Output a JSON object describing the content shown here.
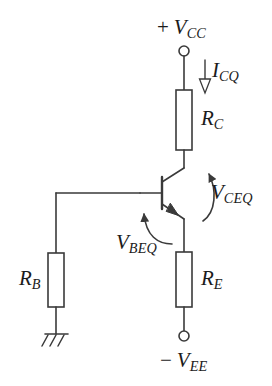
{
  "figure": {
    "type": "circuit-schematic",
    "line_color": "#3a3a3a",
    "text_color": "#1b1b1b",
    "background": "#ffffff"
  },
  "labels": {
    "vcc": {
      "sign": "+",
      "symbol": "V",
      "subscript": "CC",
      "full": "+ VCC"
    },
    "vee": {
      "sign": "−",
      "symbol": "V",
      "subscript": "EE",
      "full": "− VEE"
    },
    "icq": {
      "symbol": "I",
      "subscript": "CQ",
      "full": "ICQ"
    },
    "rc": {
      "symbol": "R",
      "subscript": "C",
      "full": "RC"
    },
    "re": {
      "symbol": "R",
      "subscript": "E",
      "full": "RE"
    },
    "rb": {
      "symbol": "R",
      "subscript": "B",
      "full": "RB"
    },
    "vceq": {
      "symbol": "V",
      "subscript": "CEQ",
      "full": "VCEQ"
    },
    "vbeq": {
      "symbol": "V",
      "subscript": "BEQ",
      "full": "VBEQ"
    }
  },
  "components": {
    "resistor_collector": {
      "name": "RC",
      "x": 176,
      "y": 90,
      "w": 16,
      "h": 60
    },
    "resistor_emitter": {
      "name": "RE",
      "x": 176,
      "y": 252,
      "w": 16,
      "h": 55
    },
    "resistor_base": {
      "name": "RB",
      "x": 48,
      "y": 253,
      "w": 16,
      "h": 54
    },
    "transistor": {
      "name": "NPN-BJT",
      "base_x": 162,
      "base_top": 178,
      "base_bottom": 208,
      "rail_x": 184
    },
    "terminal_vcc": {
      "cx": 184,
      "cy": 51,
      "r": 5
    },
    "terminal_vee": {
      "cx": 184,
      "cy": 336,
      "r": 5
    },
    "ground": {
      "x": 56,
      "y": 334
    }
  },
  "annotations": {
    "current_arrow_icq": {
      "x": 205,
      "y_start": 60,
      "y_end": 92,
      "direction": "down",
      "style": "hollow-triangle"
    },
    "arc_vceq": {
      "from": "emitter",
      "to": "collector",
      "direction": "counterclockwise"
    },
    "arc_vbeq": {
      "from": "emitter-lead",
      "to": "base",
      "direction": "counterclockwise"
    }
  }
}
